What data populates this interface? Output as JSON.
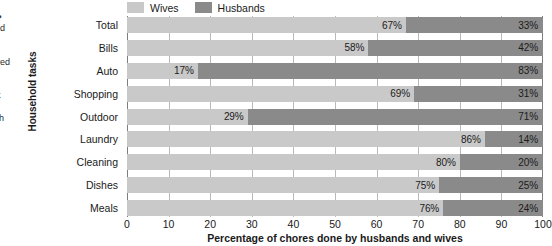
{
  "side_copy": {
    "heading": "vork?",
    "lines": [
      "studied",
      "vork",
      "ves.",
      "mployed",
      "rking",
      "highly",
      "f most",
      "the",
      "es with"
    ]
  },
  "legend": {
    "items": [
      {
        "label": "Wives",
        "color": "#c9c9c9",
        "swatch_name": "wives-swatch"
      },
      {
        "label": "Husbands",
        "color": "#8a8a8a",
        "swatch_name": "husbands-swatch"
      }
    ]
  },
  "axis": {
    "y_title": "Household tasks",
    "x_title": "Percentage of chores done by husbands and wives",
    "x_ticks": [
      "0",
      "10",
      "20",
      "30",
      "40",
      "50",
      "60",
      "70",
      "80",
      "90",
      "100"
    ]
  },
  "chart_data": {
    "type": "bar",
    "orientation": "horizontal",
    "stacked": true,
    "stacked_total": 100,
    "title": "",
    "subtitle": "",
    "xlabel": "Percentage of chores done by husbands and wives",
    "ylabel": "Household tasks",
    "xlim": [
      0,
      100
    ],
    "xticks": [
      0,
      10,
      20,
      30,
      40,
      50,
      60,
      70,
      80,
      90,
      100
    ],
    "grid": "vertical",
    "legend_position": "top-left",
    "categories": [
      "Total",
      "Bills",
      "Auto",
      "Shopping",
      "Outdoor",
      "Laundry",
      "Cleaning",
      "Dishes",
      "Meals"
    ],
    "series": [
      {
        "name": "Wives",
        "color": "#c9c9c9",
        "values": [
          67,
          58,
          17,
          69,
          29,
          86,
          80,
          75,
          76
        ],
        "labels": [
          "67%",
          "58%",
          "17%",
          "69%",
          "29%",
          "86%",
          "80%",
          "75%",
          "76%"
        ]
      },
      {
        "name": "Husbands",
        "color": "#8a8a8a",
        "values": [
          33,
          42,
          83,
          31,
          71,
          14,
          20,
          25,
          24
        ],
        "labels": [
          "33%",
          "42%",
          "83%",
          "31%",
          "71%",
          "14%",
          "20%",
          "25%",
          "24%"
        ]
      }
    ],
    "rows": [
      {
        "category": "Total",
        "wives": 67,
        "husbands": 33,
        "wives_label": "67%",
        "husbands_label": "33%"
      },
      {
        "category": "Bills",
        "wives": 58,
        "husbands": 42,
        "wives_label": "58%",
        "husbands_label": "42%"
      },
      {
        "category": "Auto",
        "wives": 17,
        "husbands": 83,
        "wives_label": "17%",
        "husbands_label": "83%"
      },
      {
        "category": "Shopping",
        "wives": 69,
        "husbands": 31,
        "wives_label": "69%",
        "husbands_label": "31%"
      },
      {
        "category": "Outdoor",
        "wives": 29,
        "husbands": 71,
        "wives_label": "29%",
        "husbands_label": "71%"
      },
      {
        "category": "Laundry",
        "wives": 86,
        "husbands": 14,
        "wives_label": "86%",
        "husbands_label": "14%"
      },
      {
        "category": "Cleaning",
        "wives": 80,
        "husbands": 20,
        "wives_label": "80%",
        "husbands_label": "20%"
      },
      {
        "category": "Dishes",
        "wives": 75,
        "husbands": 25,
        "wives_label": "75%",
        "husbands_label": "25%"
      },
      {
        "category": "Meals",
        "wives": 76,
        "husbands": 24,
        "wives_label": "76%",
        "husbands_label": "24%"
      }
    ]
  }
}
